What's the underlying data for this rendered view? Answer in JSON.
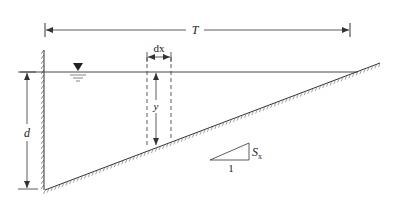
{
  "diagram": {
    "labels": {
      "top_width": "T",
      "depth": "d",
      "strip_width": "dx",
      "local_depth": "y",
      "slope_run": "1",
      "slope_rise": "S",
      "slope_rise_sub": "x"
    },
    "colors": {
      "line": "#333333",
      "hatch": "#555555",
      "background": "#ffffff"
    },
    "geometry": {
      "wall_x": 44,
      "water_surface_y": 72,
      "bottom_left": [
        45,
        190
      ],
      "bottom_right": [
        380,
        63
      ],
      "T_line_y": 30,
      "T_line_x": [
        45,
        350
      ],
      "d_line_x": 27,
      "dx_strip_x": [
        147,
        171
      ]
    }
  }
}
